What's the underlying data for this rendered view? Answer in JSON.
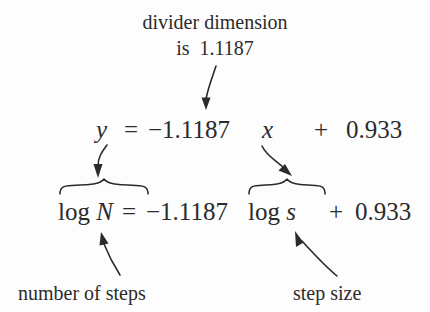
{
  "figure": {
    "width": 430,
    "height": 312,
    "background_color": "#fdfdfd",
    "ink_color": "#2b2b2b"
  },
  "caption": {
    "line1": "divider dimension",
    "line2": "is  1.1187"
  },
  "equation_generic": {
    "y": "y",
    "equals": "=",
    "slope": "−1.1187",
    "x": "x",
    "plus": "+",
    "intercept": "0.933",
    "full_text": "y = −1.1187 x + 0.933"
  },
  "equation_applied": {
    "lhs": "log N",
    "equals": "=",
    "slope": "−1.1187",
    "variable": "log s",
    "plus": "+",
    "intercept": "0.933",
    "full_text": "log N = −1.1187 log s + 0.933"
  },
  "labels": {
    "left": "number of steps",
    "right": "step size"
  },
  "annotations": {
    "slope_callout": {
      "from": "caption",
      "to": "slope coefficient −1.1187",
      "icon": "down-arrow-icon"
    },
    "y_to_logN": {
      "from": "y",
      "to": "log N",
      "icon": "curved-down-arrow-icon"
    },
    "x_to_logs": {
      "from": "x",
      "to": "log s",
      "icon": "curved-down-arrow-icon"
    },
    "number_of_steps_callout": {
      "from": "number of steps",
      "to": "N",
      "icon": "curved-up-arrow-icon"
    },
    "step_size_callout": {
      "from": "step size",
      "to": "s",
      "icon": "curved-up-arrow-icon"
    },
    "brace_left": {
      "spans": "log N",
      "icon": "over-brace-icon"
    },
    "brace_right": {
      "spans": "log s",
      "icon": "over-brace-icon"
    }
  }
}
